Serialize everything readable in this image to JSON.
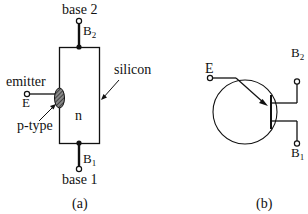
{
  "figure_a": {
    "caption": "(a)",
    "labels": {
      "base2": "base 2",
      "b2": "B",
      "b2_sub": "2",
      "silicon": "silicon",
      "emitter": "emitter",
      "e": "E",
      "p_type": "p-type",
      "n": "n",
      "b1": "B",
      "b1_sub": "1",
      "base1": "base 1"
    }
  },
  "figure_b": {
    "caption": "(b)",
    "labels": {
      "e": "E",
      "b2": "B",
      "b2_sub": "2",
      "b1": "B",
      "b1_sub": "1"
    }
  },
  "colors": {
    "ink": "#111111",
    "background": "#ffffff"
  }
}
